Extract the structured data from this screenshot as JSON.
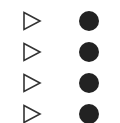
{
  "header": {
    "cutoff_text": " "
  },
  "colors": {
    "triangle_stroke": "#333333",
    "dot_fill": "#222222",
    "background": "#ffffff"
  },
  "rows": [
    {
      "left_icon": "play-outline-icon",
      "right_icon": "filled-circle-icon"
    },
    {
      "left_icon": "play-outline-icon",
      "right_icon": "filled-circle-icon"
    },
    {
      "left_icon": "play-outline-icon",
      "right_icon": "filled-circle-icon"
    },
    {
      "left_icon": "play-outline-icon",
      "right_icon": "filled-circle-icon"
    }
  ]
}
